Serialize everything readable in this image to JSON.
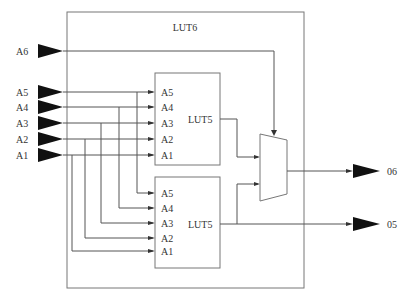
{
  "diagram": {
    "outer_block": {
      "label": "LUT6"
    },
    "inputs": [
      {
        "label": "A6",
        "y": 51
      },
      {
        "label": "A5",
        "y": 92
      },
      {
        "label": "A4",
        "y": 107
      },
      {
        "label": "A3",
        "y": 123
      },
      {
        "label": "A2",
        "y": 139
      },
      {
        "label": "A1",
        "y": 155
      }
    ],
    "upper_lut": {
      "label": "LUT5",
      "pins": [
        "A5",
        "A4",
        "A3",
        "A2",
        "A1"
      ]
    },
    "lower_lut": {
      "label": "LUT5",
      "pins": [
        "A5",
        "A4",
        "A3",
        "A2",
        "A1"
      ]
    },
    "outputs": [
      {
        "label": "06",
        "y": 171
      },
      {
        "label": "05",
        "y": 224
      }
    ],
    "colors": {
      "wire": "#555555",
      "box": "#777777",
      "triangle": "#111111",
      "text": "#333333"
    }
  }
}
